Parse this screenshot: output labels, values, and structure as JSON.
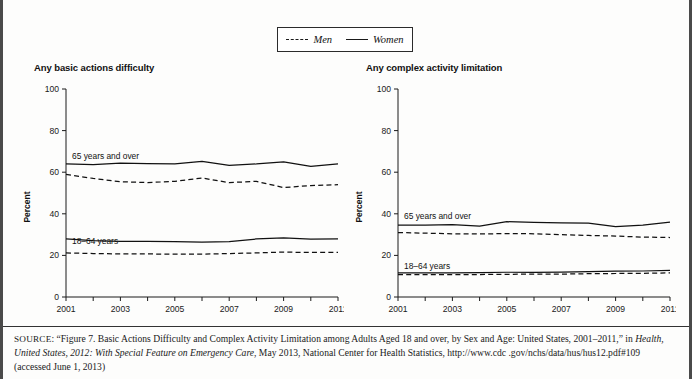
{
  "legend": {
    "entries": [
      {
        "label": "Men",
        "style": "dashed"
      },
      {
        "label": "Women",
        "style": "solid"
      }
    ]
  },
  "panels": {
    "left": {
      "title": "Any basic actions difficulty"
    },
    "right": {
      "title": "Any complex activity limitation"
    }
  },
  "axis": {
    "ylabel": "Percent",
    "yticks": [
      "0",
      "20",
      "40",
      "60",
      "80",
      "100"
    ],
    "xticks": [
      "2001",
      "2003",
      "2005",
      "2007",
      "2009",
      "2011"
    ]
  },
  "annotations": {
    "older": "65 years and over",
    "younger": "18–64 years"
  },
  "source": {
    "prefix": "SOURCE",
    "line1_a": ": “Figure 7. Basic Actions Difficulty and Complex Activity Limitation among Adults Aged 18 and over, by Sex and Age: United States,",
    "line2_a": "2001–2011,” in ",
    "line2_italic": "Health, United States, 2012: With Special Feature on Emergency Care",
    "line2_b": ", May 2013, National Center for Health Statistics, http://www.cdc",
    "line3": ".gov/nchs/data/hus/hus12.pdf#109 (accessed June 1, 2013)"
  },
  "chart_data": [
    {
      "type": "line",
      "title": "Any basic actions difficulty",
      "xlabel": "",
      "ylabel": "Percent",
      "ylim": [
        0,
        100
      ],
      "xlim": [
        2001,
        2011
      ],
      "grid": false,
      "legend_position": "top-center-shared",
      "x": [
        2001,
        2002,
        2003,
        2004,
        2005,
        2006,
        2007,
        2008,
        2009,
        2010,
        2011
      ],
      "series": [
        {
          "name": "Women, 65 years and over",
          "style": "solid",
          "group": "65 years and over",
          "values": [
            64.0,
            63.6,
            64.4,
            64.1,
            64.0,
            65.2,
            63.3,
            64.0,
            65.0,
            62.8,
            64.0
          ]
        },
        {
          "name": "Men, 65 years and over",
          "style": "dashed",
          "group": "65 years and over",
          "values": [
            59.0,
            57.0,
            55.4,
            55.0,
            55.6,
            57.2,
            55.0,
            55.6,
            52.6,
            53.6,
            54.0
          ]
        },
        {
          "name": "Women, 18–64 years",
          "style": "solid",
          "group": "18–64 years",
          "values": [
            28.0,
            27.1,
            26.8,
            26.8,
            26.6,
            26.4,
            26.6,
            27.9,
            28.4,
            27.8,
            28.0
          ]
        },
        {
          "name": "Men, 18–64 years",
          "style": "dashed",
          "group": "18–64 years",
          "values": [
            21.2,
            20.9,
            20.7,
            20.7,
            20.6,
            20.6,
            20.9,
            21.2,
            21.6,
            21.4,
            21.5
          ]
        }
      ]
    },
    {
      "type": "line",
      "title": "Any complex activity limitation",
      "xlabel": "",
      "ylabel": "Percent",
      "ylim": [
        0,
        100
      ],
      "xlim": [
        2001,
        2011
      ],
      "grid": false,
      "legend_position": "top-center-shared",
      "x": [
        2001,
        2002,
        2003,
        2004,
        2005,
        2006,
        2007,
        2008,
        2009,
        2010,
        2011
      ],
      "series": [
        {
          "name": "Women, 65 years and over",
          "style": "solid",
          "group": "65 years and over",
          "values": [
            34.6,
            34.6,
            34.8,
            34.1,
            36.2,
            35.9,
            35.6,
            35.5,
            33.8,
            34.6,
            36.0
          ]
        },
        {
          "name": "Men, 65 years and over",
          "style": "dashed",
          "group": "65 years and over",
          "values": [
            31.0,
            30.7,
            30.4,
            30.3,
            30.5,
            30.4,
            30.0,
            29.6,
            29.3,
            28.8,
            28.6
          ]
        },
        {
          "name": "Women, 18–64 years",
          "style": "solid",
          "group": "18–64 years",
          "values": [
            11.6,
            11.6,
            11.6,
            11.7,
            11.9,
            11.9,
            12.0,
            12.2,
            12.4,
            12.5,
            12.8
          ]
        },
        {
          "name": "Men, 18–64 years",
          "style": "dashed",
          "group": "18–64 years",
          "values": [
            10.7,
            10.7,
            10.8,
            10.8,
            10.9,
            11.0,
            11.0,
            11.2,
            11.3,
            11.4,
            11.6
          ]
        }
      ]
    }
  ]
}
